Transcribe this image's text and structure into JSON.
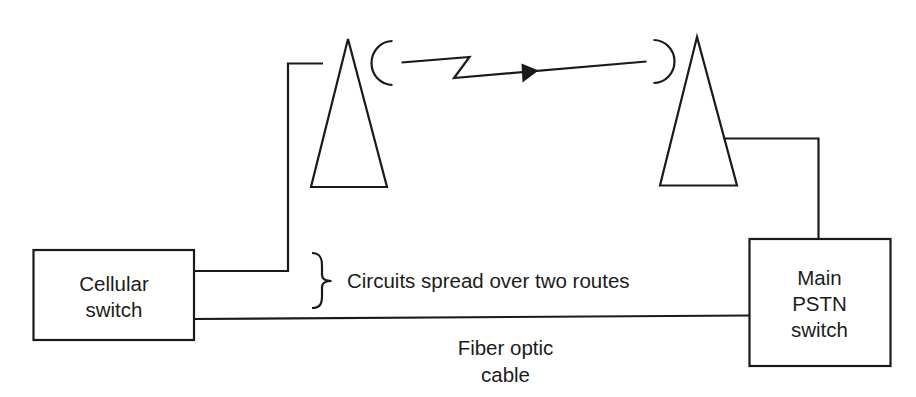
{
  "diagram": {
    "type": "network-topology",
    "nodes": {
      "cellular_switch": {
        "lines": [
          "Cellular",
          "switch"
        ]
      },
      "main_pstn_switch": {
        "lines": [
          "Main",
          "PSTN",
          "switch"
        ]
      },
      "left_antenna": {
        "icon": "antenna-tower-icon"
      },
      "right_antenna": {
        "icon": "antenna-tower-icon"
      }
    },
    "links": {
      "microwave_radio": {
        "icon": "radio-link-zigzag-arrow",
        "direction": "left-to-right"
      },
      "fiber": {
        "lines": [
          "Fiber optic",
          "cable"
        ]
      }
    },
    "annotation": {
      "brace_label": "Circuits spread over two routes"
    }
  }
}
